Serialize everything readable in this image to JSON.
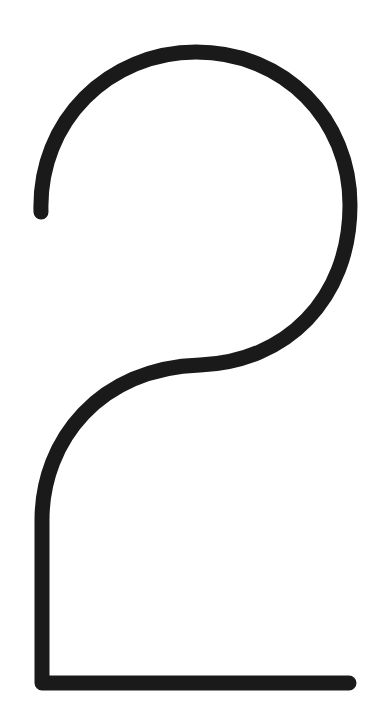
{
  "figure": {
    "title": "2",
    "stroke_color": "#1a1a1a",
    "background_color": "#ffffff",
    "stroke_width": 15
  }
}
